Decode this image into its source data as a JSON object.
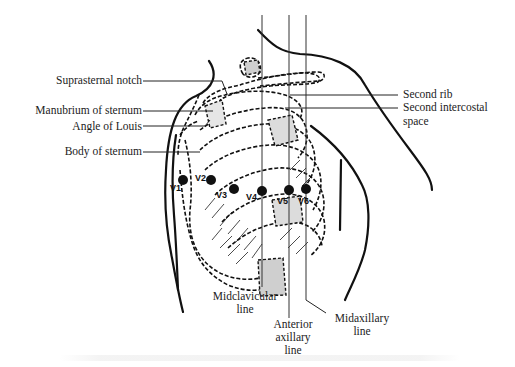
{
  "diagram": {
    "labels_left": {
      "suprasternal_notch": "Suprasternal notch",
      "manubrium": "Manubrium of sternum",
      "angle_of_louis": "Angle of Louis",
      "body_of_sternum": "Body of sternum"
    },
    "labels_right": {
      "second_rib": "Second rib",
      "second_intercostal_line1": "Second intercostal",
      "second_intercostal_line2": "space"
    },
    "labels_bottom": {
      "midclavicular_line1": "Midclavicular",
      "midclavicular_line2": "line",
      "anterior_axillary_line1": "Anterior",
      "anterior_axillary_line2": "axillary",
      "anterior_axillary_line3": "line",
      "midaxillary_line1": "Midaxillary",
      "midaxillary_line2": "line"
    },
    "electrodes": [
      {
        "id": "V1",
        "x": 183,
        "y": 180
      },
      {
        "id": "V2",
        "x": 211,
        "y": 180
      },
      {
        "id": "V3",
        "x": 234,
        "y": 189
      },
      {
        "id": "V4",
        "x": 262,
        "y": 191
      },
      {
        "id": "V5",
        "x": 289,
        "y": 190
      },
      {
        "id": "V6",
        "x": 306,
        "y": 189
      }
    ],
    "colors": {
      "ink": "#111111",
      "shading": "#cfcfcf",
      "label_text": "#222222"
    }
  }
}
